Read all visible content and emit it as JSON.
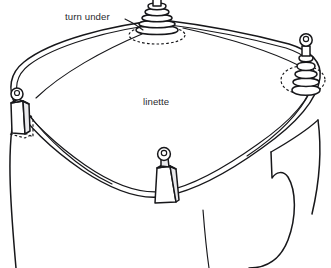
{
  "diagram": {
    "background_color": "#ffffff",
    "ink_color": "#17171a",
    "shade_color": "#e9e9ec",
    "labels": [
      {
        "id": "turn-under",
        "text": "turn under",
        "x": 65,
        "y": 20,
        "anchor": "start",
        "has_leader_line": true,
        "leader_target": "top-bobbin-weight"
      },
      {
        "id": "linette",
        "text": "linette",
        "x": 143,
        "y": 105,
        "anchor": "start",
        "has_leader_line": false,
        "leader_target": ""
      }
    ],
    "weights": [
      {
        "id": "top-bobbin-weight",
        "type": "ribbed-conical-bobbin",
        "position": "top-center",
        "has_ring": true,
        "has_dashed_shadow": true
      },
      {
        "id": "right-bobbin-weight",
        "type": "ribbed-conical-bobbin",
        "position": "right",
        "has_ring": true,
        "has_dashed_shadow": true
      },
      {
        "id": "left-box-weight",
        "type": "tapered-box",
        "position": "left",
        "has_ring": true,
        "has_dashed_shadow": true
      },
      {
        "id": "bottom-box-weight",
        "type": "tapered-box",
        "position": "bottom-center",
        "has_ring": true,
        "has_dashed_shadow": false
      }
    ],
    "fabric": {
      "id": "linette-panel",
      "shape": "rounded-square-draped",
      "hem_style": "double-line"
    },
    "form": {
      "id": "dress-form-stand",
      "description": "cylindrical form beneath the draped fabric with side fold"
    }
  }
}
